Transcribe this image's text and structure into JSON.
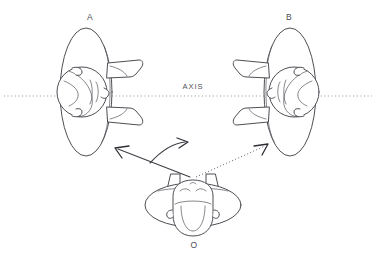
{
  "figure": {
    "background_color": "#ffffff",
    "ink_color": "#3a3a42",
    "axis_color": "#8d8d96",
    "width": 376,
    "height": 262
  },
  "axis": {
    "label": "AXIS",
    "label_x": 193,
    "label_y": 87,
    "line_y": 96,
    "line_x_start": 4,
    "line_x_end": 372,
    "style": "dotted"
  },
  "labels": {
    "left_figure": "A",
    "right_figure": "B",
    "origin_figure": "O"
  },
  "subjects": [
    {
      "id": "A",
      "label": "A",
      "label_x": 90,
      "label_y": 18,
      "description": "head and shoulders seen from above, turned to the left of the axis, face pointing right",
      "center_x": 86,
      "center_y": 92,
      "facing": "right",
      "ellipse_rx": 26,
      "ellipse_ry": 64
    },
    {
      "id": "B",
      "label": "B",
      "label_x": 289,
      "label_y": 18,
      "description": "head and shoulders seen from above, turned to the right of the axis, face pointing left",
      "center_x": 290,
      "center_y": 92,
      "facing": "left",
      "ellipse_rx": 26,
      "ellipse_ry": 64
    },
    {
      "id": "O",
      "label": "O",
      "label_x": 194,
      "label_y": 246,
      "description": "head and shoulders seen from above at the origin, face pointing down toward the viewer",
      "center_x": 193,
      "center_y": 205,
      "facing": "front",
      "ellipse_rx": 48,
      "ellipse_ry": 22
    }
  ],
  "arrows": [
    {
      "id": "arrow-to-a",
      "style": "solid",
      "from_x": 190,
      "from_y": 177,
      "to_x": 116,
      "to_y": 148,
      "target": "A",
      "description": "solid arrow from O pointing up-left toward figure A"
    },
    {
      "id": "arrow-to-b",
      "style": "dotted",
      "from_x": 196,
      "from_y": 177,
      "to_x": 267,
      "to_y": 145,
      "target": "B",
      "description": "dotted arrow from O pointing up-right toward figure B"
    },
    {
      "id": "rotation-arc",
      "style": "curved",
      "from_x": 150,
      "from_y": 162,
      "to_x": 186,
      "to_y": 144,
      "description": "curved arrow indicating rotation direction between the two headings"
    }
  ]
}
